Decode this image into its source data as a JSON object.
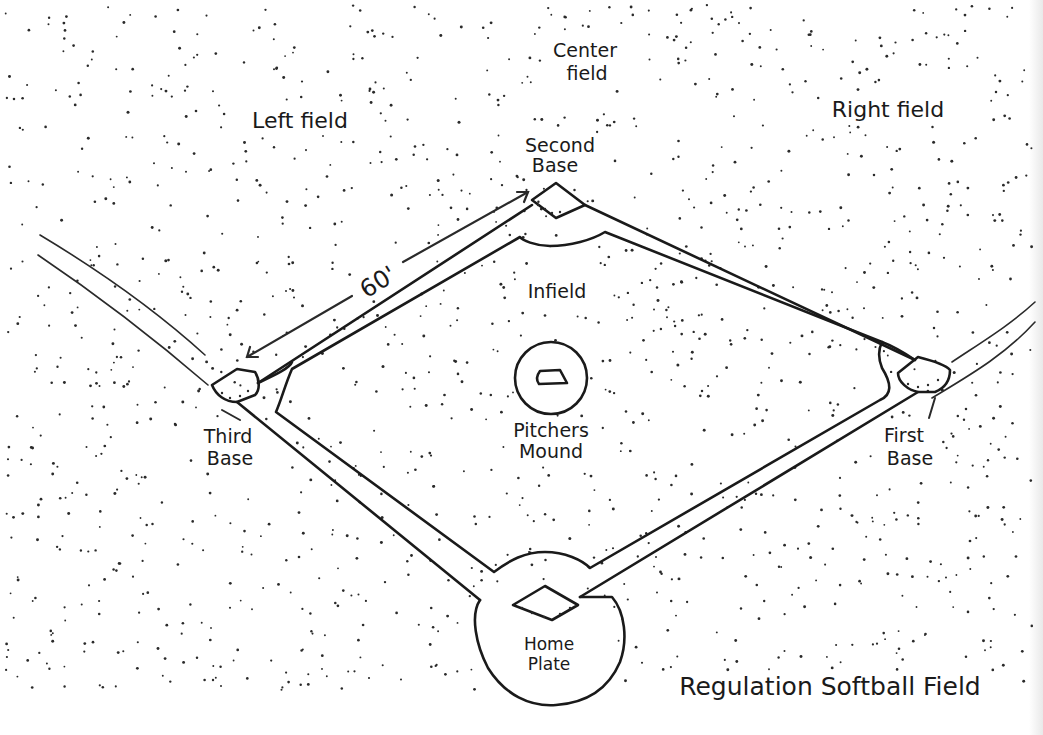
{
  "title": "Regulation Softball Field",
  "labels": {
    "center_field_line1": "Center",
    "center_field_line2": "field",
    "left_field": "Left field",
    "right_field": "Right field",
    "second_base_line1": "Second",
    "second_base_line2": "Base",
    "infield": "Infield",
    "distance": "60'",
    "third_base_line1": "Third",
    "third_base_line2": "Base",
    "first_base_line1": "First",
    "first_base_line2": "Base",
    "pitchers_mound_line1": "Pitchers",
    "pitchers_mound_line2": "Mound",
    "home_plate_line1": "Home",
    "home_plate_line2": "Plate"
  },
  "colors": {
    "ink": "#1a1a1a",
    "paper": "#ffffff"
  }
}
